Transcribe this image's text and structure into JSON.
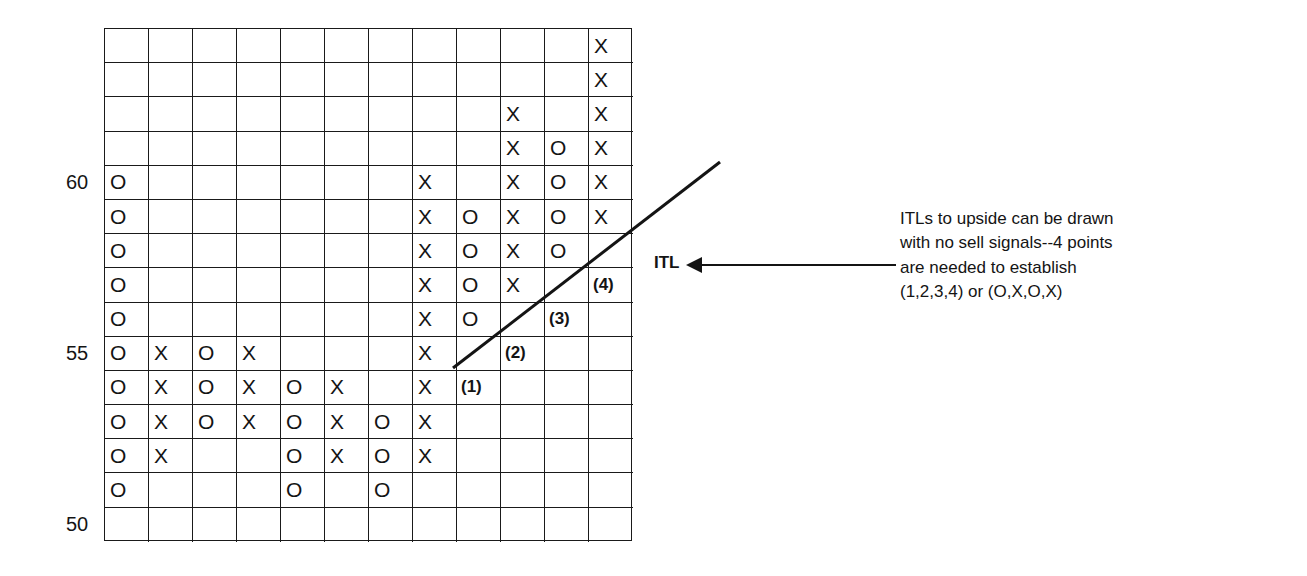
{
  "chart_data": {
    "type": "point-and-figure",
    "title": "",
    "y_axis": {
      "labels": [
        {
          "value": "60",
          "row": 4
        },
        {
          "value": "55",
          "row": 9
        },
        {
          "value": "50",
          "row": 14
        }
      ],
      "range": [
        50,
        64
      ]
    },
    "grid": {
      "columns": 12,
      "rows": 15,
      "box_size": 1
    },
    "columns": [
      {
        "index": 0,
        "type": "O",
        "from_row": 4,
        "to_row": 13,
        "high": 60,
        "low": 51
      },
      {
        "index": 1,
        "type": "X",
        "from_row": 9,
        "to_row": 12,
        "high": 55,
        "low": 52
      },
      {
        "index": 2,
        "type": "O",
        "from_row": 9,
        "to_row": 11,
        "high": 55,
        "low": 53
      },
      {
        "index": 3,
        "type": "X",
        "from_row": 9,
        "to_row": 11,
        "high": 55,
        "low": 53
      },
      {
        "index": 4,
        "type": "O",
        "from_row": 10,
        "to_row": 13,
        "high": 54,
        "low": 51
      },
      {
        "index": 5,
        "type": "X",
        "from_row": 10,
        "to_row": 12,
        "high": 54,
        "low": 52
      },
      {
        "index": 6,
        "type": "O",
        "from_row": 11,
        "to_row": 13,
        "high": 53,
        "low": 51
      },
      {
        "index": 7,
        "type": "X",
        "from_row": 4,
        "to_row": 12,
        "high": 60,
        "low": 52
      },
      {
        "index": 8,
        "type": "O",
        "from_row": 5,
        "to_row": 8,
        "high": 59,
        "low": 56
      },
      {
        "index": 9,
        "type": "X",
        "from_row": 2,
        "to_row": 7,
        "high": 62,
        "low": 57
      },
      {
        "index": 10,
        "type": "O",
        "from_row": 3,
        "to_row": 6,
        "high": 61,
        "low": 58
      },
      {
        "index": 11,
        "type": "X",
        "from_row": 0,
        "to_row": 5,
        "high": 64,
        "low": 59
      }
    ],
    "point_labels": [
      {
        "text": "(1)",
        "col": 8,
        "row": 10
      },
      {
        "text": "(2)",
        "col": 9,
        "row": 9
      },
      {
        "text": "(3)",
        "col": 10,
        "row": 8
      },
      {
        "text": "(4)",
        "col": 11,
        "row": 7
      }
    ],
    "trendline": {
      "name": "ITL",
      "from": {
        "x": 453,
        "y": 368
      },
      "to": {
        "x": 720,
        "y": 162
      }
    },
    "annotations": {
      "itl_label": "ITL",
      "note_lines": [
        "ITLs to upside can be drawn",
        "with no sell signals--4 points",
        "are needed to establish",
        "(1,2,3,4) or (O,X,O,X)"
      ]
    }
  },
  "colors": {
    "ink": "#141414",
    "background": "#ffffff"
  }
}
